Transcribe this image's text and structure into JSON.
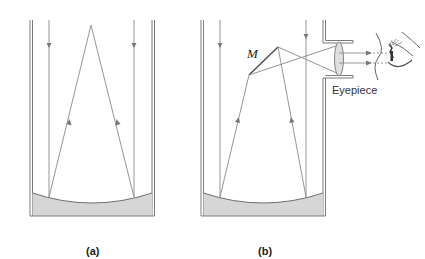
{
  "figure": {
    "panels": [
      {
        "id": "a",
        "label": "(a)"
      },
      {
        "id": "b",
        "label": "(b)"
      }
    ],
    "annotations": {
      "mirror_label": "M",
      "eyepiece_label": "Eyepiece"
    },
    "colors": {
      "ray": "#8a8a8a",
      "tube_wall": "#7a7a7a",
      "mirror_fill": "#d6d6d6",
      "lens_fill": "#e0e0e0",
      "text": "#222222"
    }
  }
}
